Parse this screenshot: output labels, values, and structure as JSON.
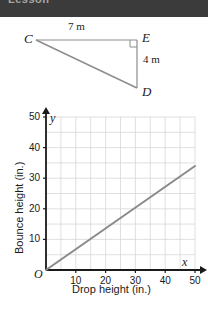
{
  "top_band": {
    "text": "Lesson",
    "background": "#3b3b3b"
  },
  "figure": {
    "name": "right-triangle-CED",
    "vertices": [
      {
        "label": "C",
        "x": 36,
        "y": 40
      },
      {
        "label": "E",
        "x": 137,
        "y": 40
      },
      {
        "label": "D",
        "x": 137,
        "y": 88
      }
    ],
    "side_labels": {
      "top": "7 m",
      "right": "4 m"
    },
    "right_angle_at": "E",
    "stroke_color": "#808080"
  },
  "chart_data": {
    "type": "line",
    "title": "",
    "xlabel": "Drop height (in.)",
    "ylabel": "Bounce height (in.)",
    "x_axis_name": "x",
    "y_axis_name": "y",
    "origin_label": "O",
    "xlim": [
      0,
      50
    ],
    "ylim": [
      0,
      50
    ],
    "xticks": [
      10,
      20,
      30,
      40,
      50
    ],
    "yticks": [
      10,
      20,
      30,
      40,
      50
    ],
    "grid": true,
    "grid_step": 5,
    "grid_color": "#d8d8d8",
    "line_color": "#8a8a8a",
    "series": [
      {
        "name": "bounce-vs-drop",
        "x": [
          0,
          50
        ],
        "values": [
          0,
          34
        ]
      }
    ]
  }
}
